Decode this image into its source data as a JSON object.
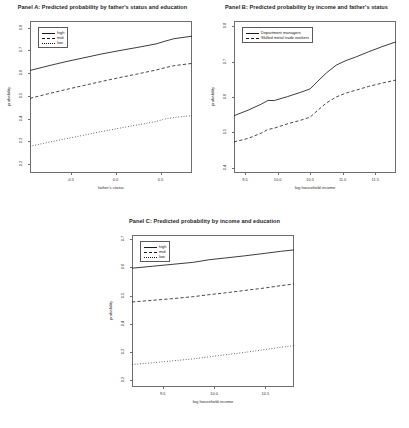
{
  "figure": {
    "background": "#ffffff",
    "line_color": "#1a1a1a",
    "axis_color": "#6e6e6e"
  },
  "panels": [
    {
      "id": "panel-a",
      "title": "Panel A: Predicted probability by father's status and education",
      "xlabel": "father's status",
      "ylabel": "probability",
      "xticks": [
        "-0.5",
        "0.0",
        "0.5"
      ],
      "yticks": [
        "0.2",
        "0.3",
        "0.4",
        "0.5",
        "0.6",
        "0.7",
        "0.8"
      ],
      "legend": [
        {
          "label": "high",
          "style": "solid"
        },
        {
          "label": "mid",
          "style": "dashed"
        },
        {
          "label": "low",
          "style": "dotted"
        }
      ]
    },
    {
      "id": "panel-b",
      "title": "Panel B: Predicted probability by income and father's status",
      "xlabel": "log household income",
      "ylabel": "probability",
      "xticks": [
        "9.5",
        "10.0",
        "10.5",
        "11.0",
        "11.5"
      ],
      "yticks": [
        "0.4",
        "0.5",
        "0.6",
        "0.7",
        "0.8"
      ],
      "legend": [
        {
          "label": "Department managers",
          "style": "solid"
        },
        {
          "label": "Skilled metal trade workers",
          "style": "dashed"
        }
      ]
    },
    {
      "id": "panel-c",
      "title": "Panel C: Predicted probability by income and education",
      "xlabel": "log household income",
      "ylabel": "probability",
      "xticks": [
        "9.5",
        "10.0",
        "10.5"
      ],
      "yticks": [
        "0.2",
        "0.3",
        "0.4",
        "0.5",
        "0.6",
        "0.7"
      ],
      "legend": [
        {
          "label": "high",
          "style": "solid"
        },
        {
          "label": "mid",
          "style": "dashed"
        },
        {
          "label": "low",
          "style": "dotted"
        }
      ]
    }
  ],
  "chart_data": [
    {
      "type": "line",
      "panel": "Panel A",
      "title": "Panel A: Predicted probability by father's status and education",
      "xlabel": "father's status",
      "ylabel": "probability",
      "xlim": [
        -0.95,
        0.85
      ],
      "ylim": [
        0.16,
        0.83
      ],
      "xticks": [
        -0.5,
        0.0,
        0.5
      ],
      "yticks": [
        0.2,
        0.3,
        0.4,
        0.5,
        0.6,
        0.7,
        0.8
      ],
      "grid": false,
      "legend_position": "top-left",
      "x": [
        -0.95,
        -0.75,
        -0.55,
        -0.35,
        -0.15,
        0.05,
        0.25,
        0.45,
        0.55,
        0.65,
        0.85
      ],
      "series": [
        {
          "name": "high",
          "style": "solid",
          "values": [
            0.612,
            0.632,
            0.651,
            0.668,
            0.685,
            0.7,
            0.714,
            0.729,
            0.741,
            0.752,
            0.763
          ]
        },
        {
          "name": "mid",
          "style": "dashed",
          "values": [
            0.489,
            0.509,
            0.528,
            0.546,
            0.564,
            0.581,
            0.597,
            0.614,
            0.624,
            0.633,
            0.643
          ]
        },
        {
          "name": "low",
          "style": "dotted",
          "values": [
            0.278,
            0.295,
            0.311,
            0.327,
            0.343,
            0.358,
            0.372,
            0.387,
            0.398,
            0.405,
            0.413
          ]
        }
      ]
    },
    {
      "type": "line",
      "panel": "Panel B",
      "title": "Panel B: Predicted probability by income and father's status",
      "xlabel": "log household income",
      "ylabel": "probability",
      "xlim": [
        9.33,
        11.82
      ],
      "ylim": [
        0.385,
        0.815
      ],
      "xticks": [
        9.5,
        10.0,
        10.5,
        11.0,
        11.5
      ],
      "yticks": [
        0.4,
        0.5,
        0.6,
        0.7,
        0.8
      ],
      "grid": false,
      "legend_position": "top-left",
      "x": [
        9.33,
        9.55,
        9.75,
        9.85,
        9.95,
        10.15,
        10.35,
        10.5,
        10.62,
        10.75,
        10.9,
        11.05,
        11.2,
        11.4,
        11.6,
        11.82
      ],
      "series": [
        {
          "name": "Department managers",
          "style": "solid",
          "values": [
            0.547,
            0.563,
            0.58,
            0.59,
            0.59,
            0.601,
            0.613,
            0.623,
            0.645,
            0.668,
            0.69,
            0.703,
            0.713,
            0.728,
            0.742,
            0.756
          ]
        },
        {
          "name": "Skilled metal trade workers",
          "style": "dashed",
          "values": [
            0.473,
            0.483,
            0.498,
            0.508,
            0.512,
            0.524,
            0.534,
            0.543,
            0.563,
            0.583,
            0.6,
            0.611,
            0.619,
            0.63,
            0.639,
            0.648
          ]
        }
      ]
    },
    {
      "type": "line",
      "panel": "Panel C",
      "title": "Panel C: Predicted probability by income and education",
      "xlabel": "log household income",
      "ylabel": "probability",
      "xlim": [
        9.2,
        10.78
      ],
      "ylim": [
        0.175,
        0.715
      ],
      "xticks": [
        9.5,
        10.0,
        10.5
      ],
      "yticks": [
        0.2,
        0.3,
        0.4,
        0.5,
        0.6,
        0.7
      ],
      "grid": false,
      "legend_position": "top-left",
      "x": [
        9.2,
        9.4,
        9.6,
        9.8,
        9.95,
        10.1,
        10.3,
        10.5,
        10.65,
        10.78
      ],
      "series": [
        {
          "name": "high",
          "style": "solid",
          "values": [
            0.597,
            0.604,
            0.611,
            0.618,
            0.627,
            0.633,
            0.641,
            0.65,
            0.657,
            0.662
          ]
        },
        {
          "name": "mid",
          "style": "dashed",
          "values": [
            0.477,
            0.483,
            0.489,
            0.496,
            0.503,
            0.509,
            0.518,
            0.527,
            0.535,
            0.541
          ]
        },
        {
          "name": "low",
          "style": "dotted",
          "values": [
            0.255,
            0.261,
            0.268,
            0.275,
            0.282,
            0.289,
            0.298,
            0.308,
            0.316,
            0.322
          ]
        }
      ]
    }
  ]
}
